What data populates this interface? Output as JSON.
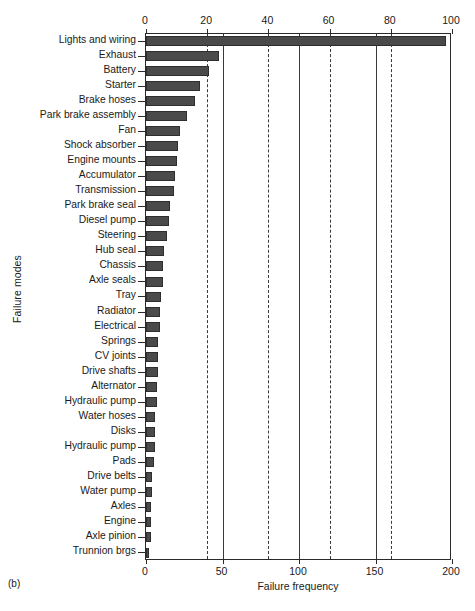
{
  "figure": {
    "caption": "(b)",
    "ylabel": "Failure modes",
    "xlabel": "Failure frequency"
  },
  "chart_data": {
    "type": "bar",
    "orientation": "horizontal",
    "title": "",
    "xlabel": "Failure frequency",
    "ylabel": "Failure modes",
    "grid": true,
    "legend": null,
    "xlim": [
      0,
      200
    ],
    "secondary_xlim": [
      0,
      100
    ],
    "secondary_xlabel": "",
    "xticks": [
      0,
      50,
      100,
      150,
      200
    ],
    "xticklabels": [
      "0",
      "50",
      "100",
      "150",
      "200"
    ],
    "secondary_xticks": [
      0,
      20,
      40,
      60,
      80,
      100
    ],
    "secondary_xticklabels": [
      "0",
      "20",
      "40",
      "60",
      "80",
      "100"
    ],
    "bar_color": "#4a4a4a",
    "categories": [
      "Lights and wiring",
      "Exhaust",
      "Battery",
      "Starter",
      "Brake hoses",
      "Park brake assembly",
      "Fan",
      "Shock absorber",
      "Engine mounts",
      "Accumulator",
      "Transmission",
      "Park brake seal",
      "Diesel pump",
      "Steering",
      "Hub seal",
      "Chassis",
      "Axle seals",
      "Tray",
      "Radiator",
      "Electrical",
      "Springs",
      "CV joints",
      "Drive shafts",
      "Alternator",
      "Hydraulic pump",
      "Water hoses",
      "Disks",
      "Hydraulic pump",
      "Pads",
      "Drive belts",
      "Water pump",
      "Axles",
      "Engine",
      "Axle pinion",
      "Trunnion brgs"
    ],
    "values": [
      196,
      48,
      41,
      35,
      32,
      27,
      22,
      21,
      20,
      19,
      18,
      16,
      15,
      14,
      12,
      11,
      11,
      10,
      9,
      9,
      8,
      8,
      8,
      7,
      7,
      6,
      6,
      6,
      5,
      4,
      4,
      3,
      3,
      3,
      2
    ]
  }
}
